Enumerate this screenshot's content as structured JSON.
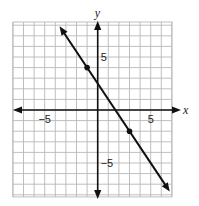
{
  "chart_data": {
    "type": "line",
    "title": "",
    "xlabel": "x",
    "ylabel": "y",
    "xlim": [
      -8,
      7
    ],
    "ylim": [
      -8.2,
      8.3
    ],
    "grid": true,
    "grid_step": 1,
    "x_ticks_labeled": [
      {
        "value": -5,
        "label": "−5"
      },
      {
        "value": 5,
        "label": "5"
      }
    ],
    "y_ticks_labeled": [
      {
        "value": 5,
        "label": "5"
      },
      {
        "value": -5,
        "label": "−5"
      }
    ],
    "series": [
      {
        "name": "line",
        "equation": "y = -1.5x + 2.5",
        "slope": -1.5,
        "intercept": 2.5,
        "arrows_both_ends": true,
        "x_range": [
          -3.6,
          6.8
        ],
        "points": [
          {
            "x": -1,
            "y": 4
          },
          {
            "x": 3,
            "y": -2
          }
        ]
      }
    ],
    "legend": null
  },
  "colors": {
    "grid": "#b8b8b8",
    "axis": "#111111",
    "line": "#111111",
    "point": "#111111"
  }
}
